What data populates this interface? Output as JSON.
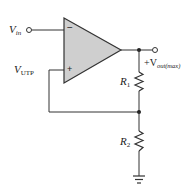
{
  "diagram": {
    "type": "op-amp comparator with positive feedback (Schmitt trigger)",
    "colors": {
      "wire": "#333333",
      "opamp_fill": "#cfcfcf",
      "background": "#ffffff"
    },
    "opamp": {
      "inverting_sign": "−",
      "noninverting_sign": "+"
    },
    "labels": {
      "vin_main": "V",
      "vin_sub": "in",
      "vutp_main": "V",
      "vutp_sub": "UTP",
      "vout_prefix": "+V",
      "vout_sub": "out(max)",
      "r1_main": "R",
      "r1_sub": "1",
      "r2_main": "R",
      "r2_sub": "2"
    },
    "components": [
      {
        "id": "opamp",
        "kind": "op-amp"
      },
      {
        "id": "R1",
        "kind": "resistor",
        "between": [
          "output",
          "feedback-node"
        ]
      },
      {
        "id": "R2",
        "kind": "resistor",
        "between": [
          "feedback-node",
          "ground"
        ]
      },
      {
        "id": "gnd",
        "kind": "ground"
      }
    ],
    "terminals": [
      "Vin input terminal",
      "+Vout(max) output terminal"
    ]
  }
}
